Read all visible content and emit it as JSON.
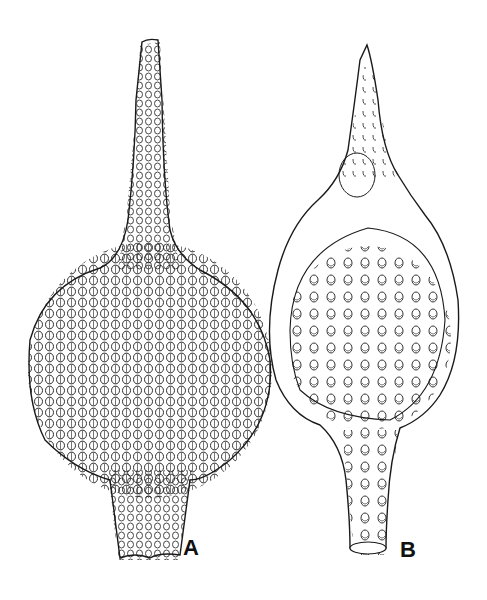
{
  "figure": {
    "panels": [
      {
        "id": "A",
        "label": "A",
        "description": "Radiolarian test with long tapering apical horn, spherical porous body covered with tubular pores, and truncated basal tube"
      },
      {
        "id": "B",
        "label": "B",
        "description": "Radiolarian test with pointed apical horn, spherical cephalis/thorax with circular pores, and cylindrical porous basal tube"
      }
    ],
    "colors": {
      "ink": "#1a1a1a",
      "paper": "#ffffff"
    }
  }
}
